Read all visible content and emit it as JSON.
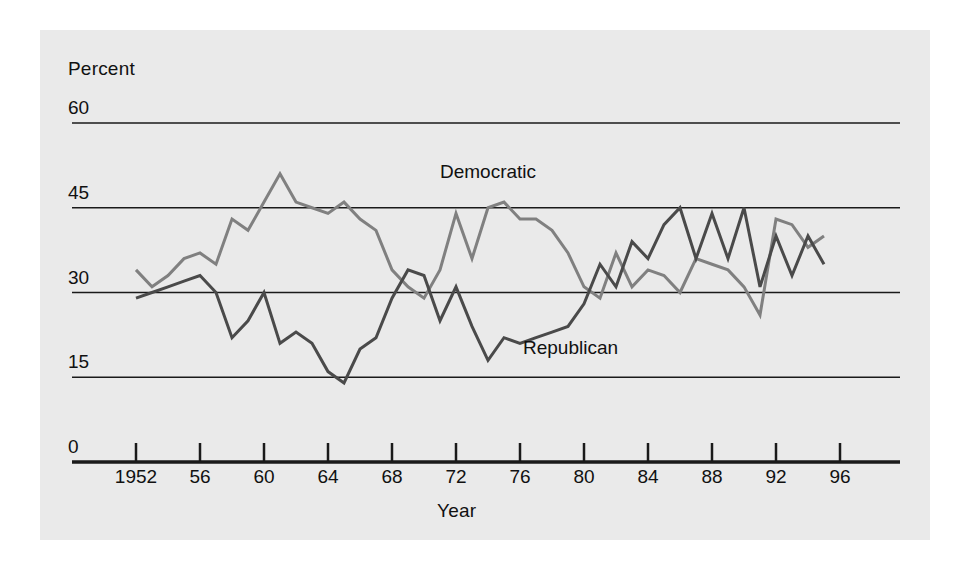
{
  "figure": {
    "background": "#ffffff",
    "panel_color": "#eaeaea",
    "axis_color": "#1a1a1a"
  },
  "axes": {
    "y_axis_title": "Percent",
    "x_axis_title": "Year",
    "y_ticks": [
      "60",
      "45",
      "30",
      "15",
      "0"
    ],
    "x_ticks": [
      "1952",
      "56",
      "60",
      "64",
      "68",
      "72",
      "76",
      "80",
      "84",
      "88",
      "92",
      "96"
    ]
  },
  "series_labels": {
    "democratic": "Democratic",
    "republican": "Republican"
  },
  "colors": {
    "democratic": "#808080",
    "republican": "#4a4a4a",
    "gridline": "#1a1a1a"
  },
  "chart_data": {
    "type": "line",
    "title": "",
    "xlabel": "Year",
    "ylabel": "Percent",
    "xlim": [
      1950,
      1999
    ],
    "ylim": [
      0,
      60
    ],
    "y_ticks": [
      0,
      15,
      30,
      45,
      60
    ],
    "x_ticks": [
      1952,
      1956,
      1960,
      1964,
      1968,
      1972,
      1976,
      1980,
      1984,
      1988,
      1992,
      1996
    ],
    "grid": "horizontal",
    "legend": "inline-annotations",
    "series": [
      {
        "name": "Democratic",
        "color": "#808080",
        "x": [
          1952,
          1953,
          1954,
          1955,
          1956,
          1957,
          1958,
          1959,
          1960,
          1961,
          1962,
          1963,
          1964,
          1965,
          1966,
          1967,
          1968,
          1969,
          1970,
          1971,
          1972,
          1973,
          1974,
          1975,
          1976,
          1977,
          1978,
          1979,
          1980,
          1981,
          1982,
          1983,
          1984,
          1985,
          1986,
          1987,
          1988,
          1989,
          1990,
          1991,
          1992,
          1993,
          1994,
          1995
        ],
        "values": [
          34,
          31,
          33,
          36,
          37,
          35,
          43,
          41,
          46,
          51,
          46,
          45,
          44,
          46,
          43,
          41,
          34,
          31,
          29,
          34,
          44,
          36,
          45,
          46,
          43,
          43,
          41,
          37,
          31,
          29,
          37,
          31,
          34,
          33,
          30,
          36,
          35,
          34,
          31,
          26,
          43,
          42,
          38,
          40
        ],
        "marker": "none",
        "linewidth": 3
      },
      {
        "name": "Republican",
        "color": "#4a4a4a",
        "x": [
          1952,
          1953,
          1954,
          1955,
          1956,
          1957,
          1958,
          1959,
          1960,
          1961,
          1962,
          1963,
          1964,
          1965,
          1966,
          1967,
          1968,
          1969,
          1970,
          1971,
          1972,
          1973,
          1974,
          1975,
          1976,
          1977,
          1978,
          1979,
          1980,
          1981,
          1982,
          1983,
          1984,
          1985,
          1986,
          1987,
          1988,
          1989,
          1990,
          1991,
          1992,
          1993,
          1994,
          1995
        ],
        "values": [
          29,
          30,
          31,
          32,
          33,
          30,
          22,
          25,
          30,
          21,
          23,
          21,
          16,
          14,
          20,
          22,
          29,
          34,
          33,
          25,
          31,
          24,
          18,
          22,
          21,
          22,
          23,
          24,
          28,
          35,
          31,
          39,
          36,
          42,
          45,
          36,
          44,
          36,
          45,
          31,
          40,
          33,
          40,
          35
        ],
        "marker": "none",
        "linewidth": 3
      }
    ]
  }
}
